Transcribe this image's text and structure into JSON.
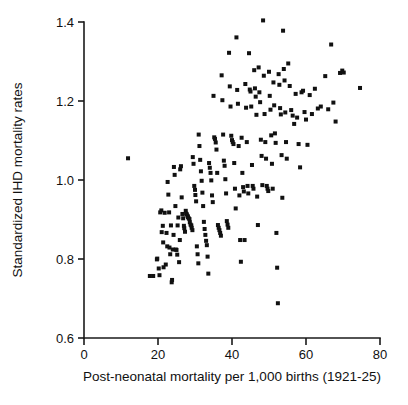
{
  "chart_data": {
    "type": "scatter",
    "title": "",
    "xlabel": "Post-neonatal mortality per 1,000 births (1921-25)",
    "ylabel": "Standardized IHD mortality rates",
    "xlim": [
      0,
      80
    ],
    "ylim": [
      0.6,
      1.4
    ],
    "xticks": [
      0,
      20,
      40,
      60,
      80
    ],
    "yticks": [
      0.6,
      0.8,
      1.0,
      1.2,
      1.4
    ],
    "xtick_labels": [
      "0",
      "20",
      "40",
      "60",
      "80"
    ],
    "ytick_labels": [
      "0.6",
      "0.8",
      "1.0",
      "1.2",
      "1.4"
    ],
    "grid": false,
    "legend": null,
    "marker": "square",
    "marker_color": "#111111",
    "marker_size_px": 4,
    "n_points": 213,
    "points": [
      [
        11.9,
        1.055
      ],
      [
        17.8,
        0.757
      ],
      [
        18.7,
        0.757
      ],
      [
        19.7,
        0.799
      ],
      [
        19.8,
        0.801
      ],
      [
        20.2,
        0.776
      ],
      [
        20.4,
        0.759
      ],
      [
        20.6,
        0.918
      ],
      [
        20.9,
        0.923
      ],
      [
        21.0,
        0.868
      ],
      [
        21.3,
        0.884
      ],
      [
        21.4,
        0.842
      ],
      [
        21.5,
        0.779
      ],
      [
        21.8,
        0.917
      ],
      [
        22.1,
        0.786
      ],
      [
        22.3,
        0.866
      ],
      [
        22.5,
        0.832
      ],
      [
        22.6,
        0.995
      ],
      [
        22.8,
        0.963
      ],
      [
        23.0,
        0.918
      ],
      [
        23.1,
        0.829
      ],
      [
        23.3,
        0.812
      ],
      [
        23.5,
        0.885
      ],
      [
        23.7,
        0.741
      ],
      [
        23.8,
        0.747
      ],
      [
        24.0,
        0.824
      ],
      [
        24.2,
        0.861
      ],
      [
        24.3,
        1.033
      ],
      [
        24.5,
        1.013
      ],
      [
        24.7,
        0.934
      ],
      [
        24.8,
        0.824
      ],
      [
        25.0,
        0.823
      ],
      [
        25.2,
        0.811
      ],
      [
        25.3,
        0.885
      ],
      [
        25.5,
        0.905
      ],
      [
        25.7,
        0.792
      ],
      [
        25.9,
        0.848
      ],
      [
        26.0,
        1.027
      ],
      [
        26.2,
        1.035
      ],
      [
        26.4,
        0.956
      ],
      [
        26.6,
        0.914
      ],
      [
        26.8,
        0.903
      ],
      [
        27.0,
        0.884
      ],
      [
        27.1,
        0.878
      ],
      [
        27.3,
        0.869
      ],
      [
        27.5,
        0.922
      ],
      [
        27.6,
        0.915
      ],
      [
        27.8,
        0.913
      ],
      [
        28.0,
        0.909
      ],
      [
        28.1,
        0.906
      ],
      [
        28.3,
        0.903
      ],
      [
        28.5,
        0.901
      ],
      [
        28.6,
        0.893
      ],
      [
        28.8,
        0.887
      ],
      [
        29.0,
        0.885
      ],
      [
        29.1,
        0.879
      ],
      [
        29.3,
        0.873
      ],
      [
        29.4,
        1.058
      ],
      [
        29.6,
        1.041
      ],
      [
        29.8,
        0.985
      ],
      [
        30.0,
        0.975
      ],
      [
        30.1,
        0.962
      ],
      [
        30.3,
        0.946
      ],
      [
        30.5,
        0.832
      ],
      [
        30.7,
        0.812
      ],
      [
        30.9,
        0.789
      ],
      [
        31.0,
        1.115
      ],
      [
        31.2,
        1.086
      ],
      [
        31.4,
        1.051
      ],
      [
        31.6,
        1.022
      ],
      [
        31.8,
        0.998
      ],
      [
        32.0,
        0.968
      ],
      [
        32.2,
        0.934
      ],
      [
        32.4,
        0.894
      ],
      [
        32.6,
        0.876
      ],
      [
        32.8,
        0.861
      ],
      [
        33.0,
        0.846
      ],
      [
        33.2,
        0.835
      ],
      [
        33.4,
        0.806
      ],
      [
        33.6,
        0.763
      ],
      [
        33.8,
        1.043
      ],
      [
        34.0,
        1.031
      ],
      [
        34.2,
        1.018
      ],
      [
        34.4,
        0.999
      ],
      [
        34.6,
        0.961
      ],
      [
        34.8,
        0.944
      ],
      [
        35.0,
        1.213
      ],
      [
        35.2,
        1.108
      ],
      [
        35.4,
        1.104
      ],
      [
        35.6,
        1.095
      ],
      [
        35.8,
        1.077
      ],
      [
        36.0,
        1.018
      ],
      [
        36.2,
        0.886
      ],
      [
        36.4,
        0.879
      ],
      [
        36.6,
        0.873
      ],
      [
        36.8,
        0.866
      ],
      [
        37.0,
        0.859
      ],
      [
        37.2,
        1.265
      ],
      [
        37.4,
        1.202
      ],
      [
        37.6,
        1.115
      ],
      [
        37.8,
        1.049
      ],
      [
        38.0,
        1.036
      ],
      [
        38.2,
        1.002
      ],
      [
        38.4,
        0.966
      ],
      [
        38.6,
        0.896
      ],
      [
        38.8,
        0.887
      ],
      [
        39.0,
        0.879
      ],
      [
        39.2,
        1.322
      ],
      [
        39.4,
        1.237
      ],
      [
        39.6,
        1.186
      ],
      [
        39.8,
        1.112
      ],
      [
        40.0,
        1.101
      ],
      [
        40.2,
        1.096
      ],
      [
        40.4,
        1.091
      ],
      [
        40.6,
        1.043
      ],
      [
        40.8,
        0.978
      ],
      [
        41.0,
        0.928
      ],
      [
        41.2,
        1.361
      ],
      [
        41.4,
        1.228
      ],
      [
        41.6,
        1.193
      ],
      [
        41.8,
        1.086
      ],
      [
        42.0,
        0.961
      ],
      [
        42.2,
        0.848
      ],
      [
        42.4,
        0.793
      ],
      [
        42.6,
        1.107
      ],
      [
        42.8,
        1.018
      ],
      [
        43.0,
        0.982
      ],
      [
        43.2,
        0.971
      ],
      [
        43.4,
        0.848
      ],
      [
        43.6,
        1.243
      ],
      [
        43.8,
        1.183
      ],
      [
        44.0,
        1.096
      ],
      [
        44.2,
        0.985
      ],
      [
        44.4,
        0.966
      ],
      [
        44.6,
        1.321
      ],
      [
        44.8,
        1.229
      ],
      [
        45.0,
        1.224
      ],
      [
        45.2,
        1.186
      ],
      [
        45.4,
        1.038
      ],
      [
        45.6,
        0.985
      ],
      [
        45.8,
        0.978
      ],
      [
        46.0,
        1.278
      ],
      [
        46.2,
        1.232
      ],
      [
        46.4,
        1.211
      ],
      [
        46.6,
        1.165
      ],
      [
        46.8,
        0.958
      ],
      [
        47.0,
        0.886
      ],
      [
        47.2,
        1.285
      ],
      [
        47.4,
        1.222
      ],
      [
        47.6,
        1.197
      ],
      [
        47.8,
        1.102
      ],
      [
        48.0,
        1.061
      ],
      [
        48.2,
        0.987
      ],
      [
        48.4,
        1.404
      ],
      [
        48.6,
        1.264
      ],
      [
        48.8,
        1.167
      ],
      [
        49.0,
        1.096
      ],
      [
        49.2,
        1.054
      ],
      [
        49.4,
        0.985
      ],
      [
        49.6,
        0.978
      ],
      [
        49.8,
        0.972
      ],
      [
        50.0,
        1.274
      ],
      [
        50.2,
        1.213
      ],
      [
        50.4,
        1.178
      ],
      [
        50.6,
        1.113
      ],
      [
        50.8,
        1.041
      ],
      [
        51.0,
        0.978
      ],
      [
        51.2,
        1.247
      ],
      [
        51.4,
        1.189
      ],
      [
        51.6,
        1.118
      ],
      [
        51.8,
        1.094
      ],
      [
        52.0,
        0.866
      ],
      [
        52.2,
        0.778
      ],
      [
        52.4,
        0.688
      ],
      [
        52.6,
        1.268
      ],
      [
        52.8,
        1.241
      ],
      [
        53.0,
        1.182
      ],
      [
        53.2,
        1.166
      ],
      [
        53.4,
        1.063
      ],
      [
        53.6,
        0.955
      ],
      [
        53.8,
        1.378
      ],
      [
        54.0,
        1.281
      ],
      [
        54.2,
        1.252
      ],
      [
        54.4,
        1.171
      ],
      [
        54.6,
        1.096
      ],
      [
        54.8,
        1.054
      ],
      [
        55.2,
        1.295
      ],
      [
        55.6,
        1.238
      ],
      [
        56.0,
        1.177
      ],
      [
        56.4,
        1.163
      ],
      [
        56.8,
        1.142
      ],
      [
        57.2,
        1.218
      ],
      [
        57.6,
        1.158
      ],
      [
        58.0,
        1.091
      ],
      [
        58.4,
        1.032
      ],
      [
        58.8,
        1.222
      ],
      [
        59.2,
        1.226
      ],
      [
        59.6,
        1.172
      ],
      [
        60.0,
        1.153
      ],
      [
        60.4,
        1.089
      ],
      [
        61.0,
        1.215
      ],
      [
        61.6,
        1.167
      ],
      [
        62.4,
        1.231
      ],
      [
        63.2,
        1.181
      ],
      [
        64.0,
        1.186
      ],
      [
        65.2,
        1.263
      ],
      [
        66.0,
        1.179
      ],
      [
        66.8,
        1.343
      ],
      [
        67.4,
        1.196
      ],
      [
        68.0,
        1.148
      ],
      [
        69.2,
        1.271
      ],
      [
        69.8,
        1.277
      ],
      [
        70.2,
        1.272
      ],
      [
        74.6,
        1.233
      ]
    ]
  },
  "axes": {
    "y_axis_label": "Standardized IHD mortality rates",
    "x_axis_label": "Post-neonatal mortality per 1,000 births (1921-25)"
  }
}
